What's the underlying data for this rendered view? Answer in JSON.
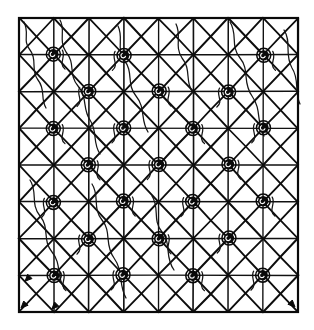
{
  "figure": {
    "kind": "line-drawing",
    "medium": "black ink engraving on white ground",
    "canvas": {
      "width": 314,
      "height": 330,
      "background": "#ffffff"
    },
    "ink_color": "#000000"
  },
  "frame": {
    "name": "outer-boundary",
    "left": 19,
    "top": 18,
    "right": 298,
    "bottom": 312,
    "width": 279,
    "height": 294,
    "stroke_width": 2.2
  },
  "grid": {
    "columns": 8,
    "rows": 8,
    "cell_width": 34.875,
    "cell_height": 36.75,
    "line_stroke_width": 1.5,
    "diagonals_per_cell": 2,
    "diagonal_stroke_width": 1.9,
    "description": "Every cell carries both of its diagonals, producing a continuous X pattern across the field"
  },
  "nodes": {
    "label": "dislocation-node",
    "count": 24,
    "glyph": "dark inked spiral blob",
    "radius": 5.2,
    "color": "#0a0a0a",
    "positions": [
      {
        "col": 1,
        "row": 1
      },
      {
        "col": 3,
        "row": 1
      },
      {
        "col": 7,
        "row": 1
      },
      {
        "col": 2,
        "row": 2
      },
      {
        "col": 4,
        "row": 2
      },
      {
        "col": 6,
        "row": 2
      },
      {
        "col": 1,
        "row": 3
      },
      {
        "col": 3,
        "row": 3
      },
      {
        "col": 5,
        "row": 3
      },
      {
        "col": 7,
        "row": 3
      },
      {
        "col": 2,
        "row": 4
      },
      {
        "col": 4,
        "row": 4
      },
      {
        "col": 6,
        "row": 4
      },
      {
        "col": 1,
        "row": 5
      },
      {
        "col": 3,
        "row": 5
      },
      {
        "col": 5,
        "row": 5
      },
      {
        "col": 7,
        "row": 5
      },
      {
        "col": 2,
        "row": 6
      },
      {
        "col": 4,
        "row": 6
      },
      {
        "col": 6,
        "row": 6
      },
      {
        "col": 1,
        "row": 7
      },
      {
        "col": 3,
        "row": 7
      },
      {
        "col": 5,
        "row": 7
      },
      {
        "col": 7,
        "row": 7
      }
    ]
  },
  "curves": {
    "label": "slip-trace",
    "count": 9,
    "stroke_width": 1.25,
    "style": "free-hand sinuous line threading diagonally through the lattice",
    "paths": [
      "M 24 22 C 30 34, 22 40, 30 50 C 38 60, 30 70, 38 80 C 46 90, 40 98, 46 108",
      "M 60 20 C 66 30, 58 40, 66 52 C 76 64, 68 74, 78 86 C 88 98, 82 108, 90 120 C 98 132, 92 142, 100 154",
      "M 118 26 C 124 38, 116 48, 124 60 C 134 72, 126 84, 136 96 C 146 108, 140 120, 148 132",
      "M 176 24 C 182 36, 174 46, 182 58 C 192 70, 184 82, 194 94",
      "M 230 22 C 238 34, 230 46, 240 58 C 250 70, 242 82, 252 96 C 262 110, 256 122, 264 136",
      "M 284 30 C 292 42, 284 54, 292 68 C 300 80, 294 92, 300 104",
      "M 30 180 C 38 192, 30 204, 40 216 C 50 228, 42 240, 52 252 C 62 264, 56 276, 64 288",
      "M 92 184 C 100 196, 92 208, 102 220 C 112 232, 104 244, 114 258 C 124 272, 118 284, 126 298",
      "M 152 196 C 160 208, 152 220, 162 232 C 172 244, 164 256, 174 270"
    ]
  },
  "arrows": {
    "label": "direction-marker",
    "count": 4,
    "description": "small arrowheads terminating selected lattice diagonals near the lower-left and lower-right corners"
  },
  "annotations": {
    "caption": "",
    "axis_labels": [],
    "legend": []
  }
}
